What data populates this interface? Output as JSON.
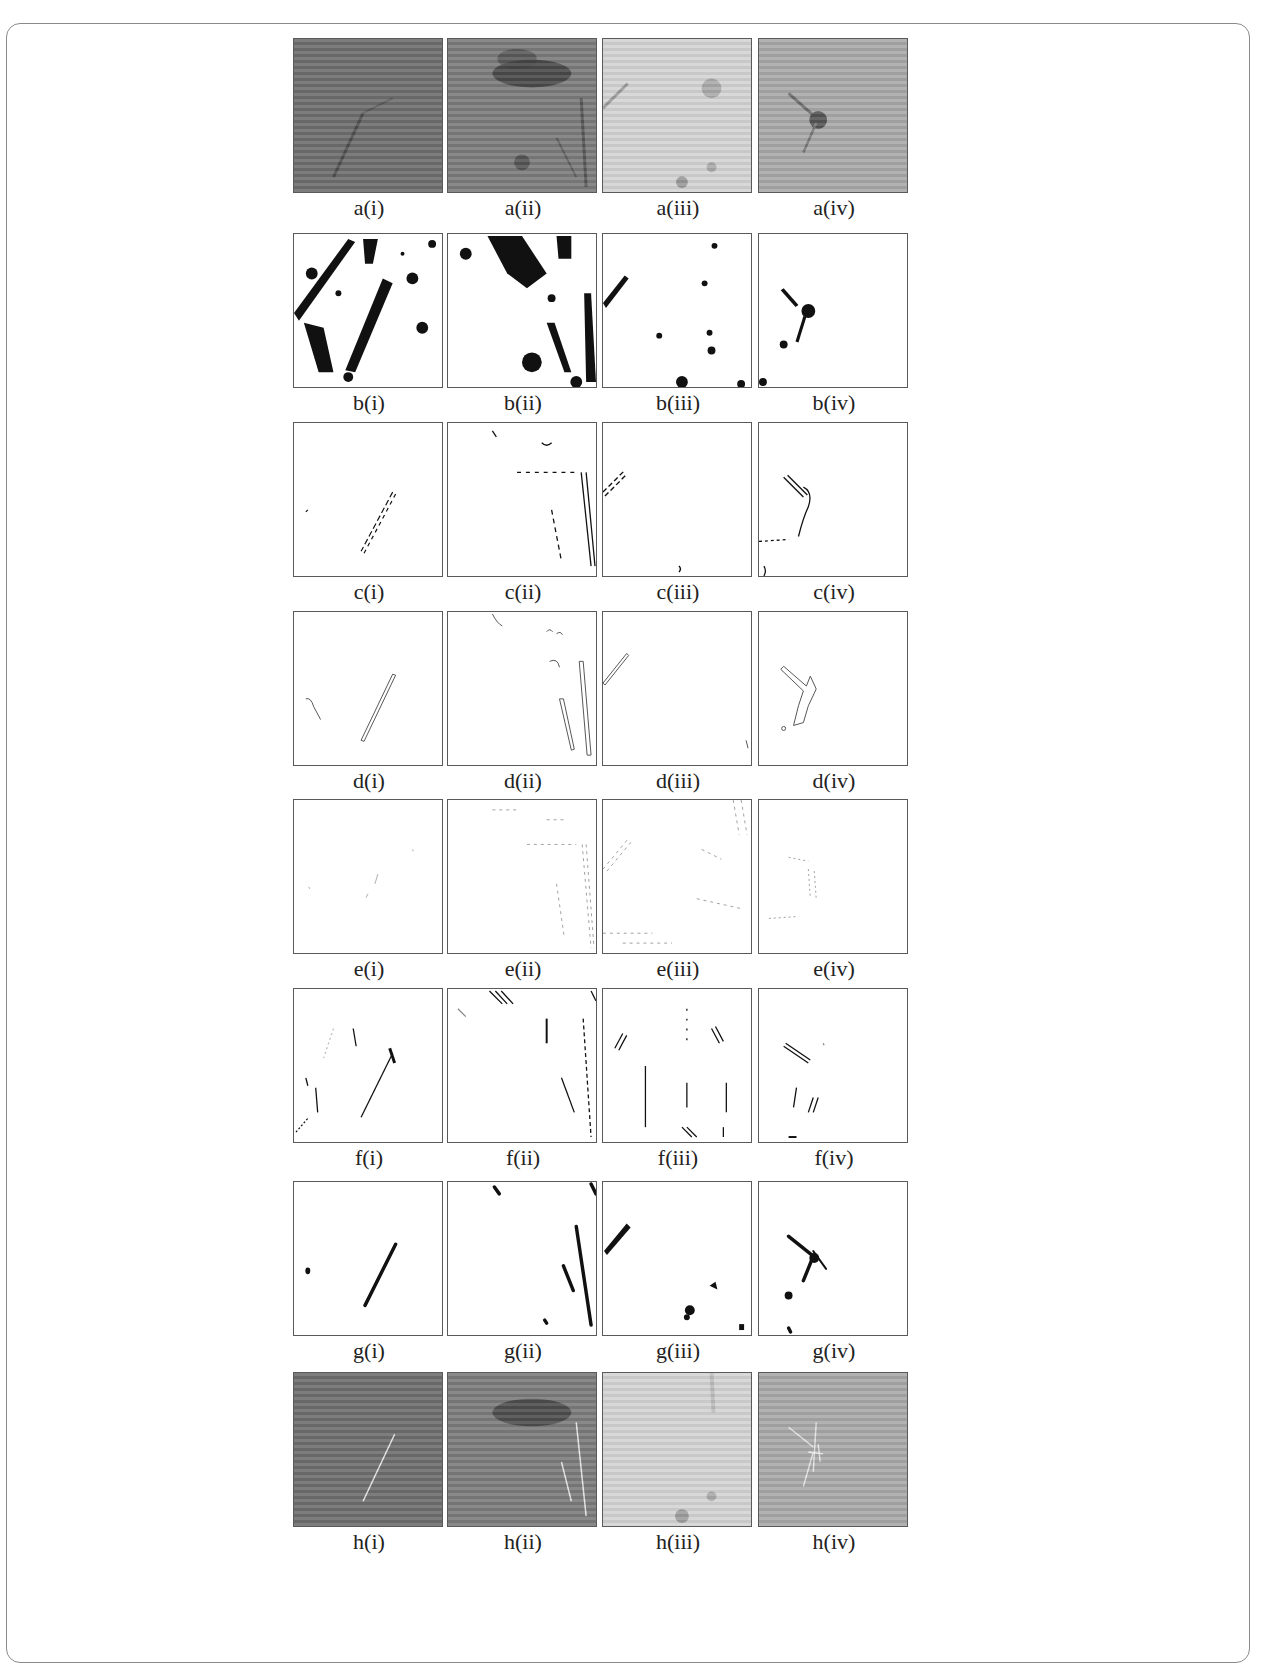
{
  "figure": {
    "columns": [
      "i",
      "ii",
      "iii",
      "iv"
    ],
    "rows": [
      {
        "id": "a",
        "kind": "grayscale-original",
        "labels": [
          "a(i)",
          "a(ii)",
          "a(iii)",
          "a(iv)"
        ]
      },
      {
        "id": "b",
        "kind": "binary-threshold",
        "labels": [
          "b(i)",
          "b(ii)",
          "b(iii)",
          "b(iv)"
        ]
      },
      {
        "id": "c",
        "kind": "edge-map",
        "labels": [
          "c(i)",
          "c(ii)",
          "c(iii)",
          "c(iv)"
        ]
      },
      {
        "id": "d",
        "kind": "contour-outline",
        "labels": [
          "d(i)",
          "d(ii)",
          "d(iii)",
          "d(iv)"
        ]
      },
      {
        "id": "e",
        "kind": "sparse-edges",
        "labels": [
          "e(i)",
          "e(ii)",
          "e(iii)",
          "e(iv)"
        ]
      },
      {
        "id": "f",
        "kind": "directional-edges",
        "labels": [
          "f(i)",
          "f(ii)",
          "f(iii)",
          "f(iv)"
        ]
      },
      {
        "id": "g",
        "kind": "segmented-cracks",
        "labels": [
          "g(i)",
          "g(ii)",
          "g(iii)",
          "g(iv)"
        ]
      },
      {
        "id": "h",
        "kind": "overlay-on-original",
        "labels": [
          "h(i)",
          "h(ii)",
          "h(iii)",
          "h(iv)"
        ]
      }
    ]
  },
  "colors": {
    "frame_border": "#8a8a8a",
    "panel_border": "#5a5a5a",
    "label_text": "#222222",
    "crack_fill": "#111111",
    "overlay_line": "#e8e8e8"
  }
}
